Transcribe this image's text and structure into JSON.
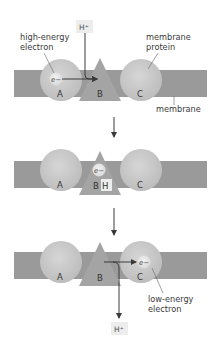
{
  "diagram": {
    "title": "",
    "colors": {
      "membrane": "#9a9a9a",
      "protein_circle": "#c9c9c9",
      "protein_circle_edge": "#b3b3b3",
      "protein_triangle": "#a4a4a4",
      "electron": "#e6e6e6",
      "proton_box": "#ededed",
      "arrow": "#3a3a3a",
      "text": "#3a3a3a"
    },
    "labels": {
      "high_energy_line1": "high-energy",
      "high_energy_line2": "electron",
      "membrane_protein_line1": "membrane",
      "membrane_protein_line2": "protein",
      "membrane": "membrane",
      "low_energy_line1": "low-energy",
      "low_energy_line2": "electron"
    },
    "panels": [
      {
        "step": 1,
        "proteins": {
          "a": "A",
          "b": "B",
          "c": "C"
        },
        "electron": "e−",
        "proton": "H⁺",
        "electron_on": "A"
      },
      {
        "step": 2,
        "proteins": {
          "a": "A",
          "b": "B",
          "c": "C"
        },
        "electron": "e−",
        "proton": "H",
        "electron_on": "B"
      },
      {
        "step": 3,
        "proteins": {
          "a": "A",
          "b": "B",
          "c": "C"
        },
        "electron": "e−",
        "proton": "H⁺",
        "electron_on": "C"
      }
    ]
  }
}
